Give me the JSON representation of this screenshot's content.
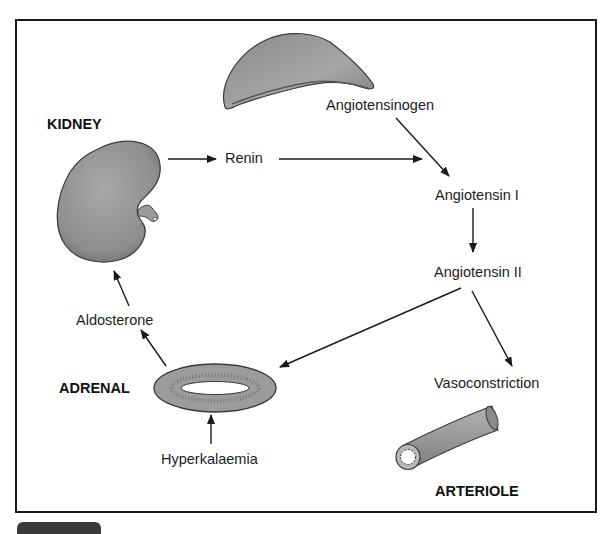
{
  "diagram": {
    "organs": {
      "kidney": "KIDNEY",
      "adrenal": "ADRENAL",
      "arteriole": "ARTERIOLE"
    },
    "nodes": {
      "angiotensinogen": "Angiotensinogen",
      "renin": "Renin",
      "angiotensin_1": "Angiotensin I",
      "angiotensin_2": "Angiotensin II",
      "vasoconstriction": "Vasoconstriction",
      "aldosterone": "Aldosterone",
      "hyperkalaemia": "Hyperkalaemia"
    },
    "edges": [
      {
        "from": "kidney",
        "to": "renin"
      },
      {
        "from": "renin",
        "to": "angiotensin_1"
      },
      {
        "from": "angiotensinogen",
        "to": "angiotensin_1"
      },
      {
        "from": "angiotensin_1",
        "to": "angiotensin_2"
      },
      {
        "from": "angiotensin_2",
        "to": "adrenal"
      },
      {
        "from": "angiotensin_2",
        "to": "vasoconstriction"
      },
      {
        "from": "adrenal",
        "to": "aldosterone"
      },
      {
        "from": "aldosterone",
        "to": "kidney"
      },
      {
        "from": "hyperkalaemia",
        "to": "adrenal"
      }
    ],
    "colors": {
      "organ_fill": "#9a9a9a",
      "organ_stroke": "#3a3a3a",
      "line": "#1a1a1a"
    }
  }
}
